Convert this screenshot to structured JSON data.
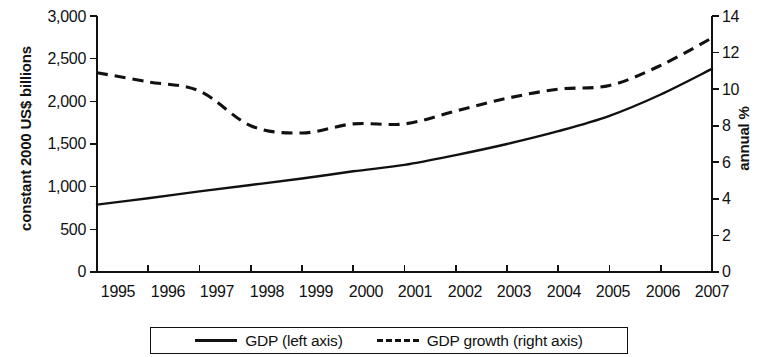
{
  "chart_data": {
    "type": "line",
    "title": "",
    "xlabel": "",
    "ylabel": "constant 2000 US$ billions",
    "ylabel_right": "annual %",
    "categories": [
      "1995",
      "1996",
      "1997",
      "1998",
      "1999",
      "2000",
      "2001",
      "2002",
      "2003",
      "2004",
      "2005",
      "2006",
      "2007"
    ],
    "x": [
      1995,
      1996,
      1997,
      1998,
      1999,
      2000,
      2001,
      2002,
      2003,
      2004,
      2005,
      2006,
      2007
    ],
    "ylim": [
      0,
      3000
    ],
    "ylim_right": [
      0,
      14
    ],
    "yticks": [
      "0",
      "500",
      "1,000",
      "1,500",
      "2,000",
      "2,500",
      "3,000"
    ],
    "ytick_values": [
      0,
      500,
      1000,
      1500,
      2000,
      2500,
      3000
    ],
    "yticks_right": [
      "0",
      "2",
      "4",
      "6",
      "8",
      "10",
      "12",
      "14"
    ],
    "ytick_values_right": [
      0,
      2,
      4,
      6,
      8,
      10,
      12,
      14
    ],
    "grid": false,
    "legend_position": "bottom",
    "series": [
      {
        "name": "GDP (left axis)",
        "axis": "left",
        "style": "solid",
        "color": "#111111",
        "units": "constant 2000 US$ billions",
        "values": [
          790,
          865,
          945,
          1020,
          1095,
          1180,
          1255,
          1370,
          1500,
          1650,
          1830,
          2080,
          2380
        ]
      },
      {
        "name": "GDP growth (right axis)",
        "axis": "right",
        "style": "dashed",
        "color": "#111111",
        "units": "annual %",
        "values": [
          10.9,
          10.4,
          9.9,
          8.0,
          7.6,
          8.1,
          8.1,
          8.8,
          9.5,
          10.0,
          10.2,
          11.3,
          12.8
        ]
      }
    ],
    "legend": [
      {
        "label": "GDP (left axis)",
        "style": "solid"
      },
      {
        "label": "GDP growth (right axis)",
        "style": "dashed"
      }
    ]
  }
}
